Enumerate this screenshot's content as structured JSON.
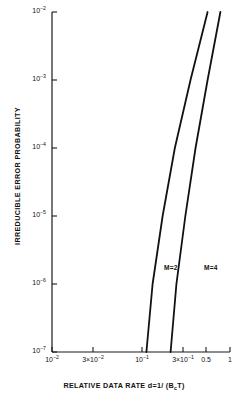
{
  "chart_data": {
    "type": "line",
    "title": "",
    "xlabel": "RELATIVE DATA RATE d=1/ (BₑT)",
    "ylabel": "IRREDUCIBLE ERROR PROBABILITY",
    "xscale": "log",
    "yscale": "log",
    "xlim": [
      0.01,
      1
    ],
    "ylim": [
      1e-07,
      0.01
    ],
    "grid": false,
    "legend_position": "inline-annotations",
    "xticks": [
      {
        "value": 0.01,
        "label": "10",
        "exp": "−2",
        "px": 52
      },
      {
        "value": 0.03,
        "label": "3×10",
        "exp": "−2",
        "px": 93
      },
      {
        "value": 0.1,
        "label": "10",
        "exp": "−1",
        "px": 142
      },
      {
        "value": 0.3,
        "label": "3×10",
        "exp": "−1",
        "px": 183
      },
      {
        "value": 0.5,
        "label": "0.5",
        "exp": "",
        "px": 206
      },
      {
        "value": 1.0,
        "label": "1",
        "exp": "",
        "px": 230
      }
    ],
    "yticks": [
      {
        "value": 0.01,
        "label": "10",
        "exp": "−2",
        "px": 12
      },
      {
        "value": 0.001,
        "label": "10",
        "exp": "−3",
        "px": 80
      },
      {
        "value": 0.0001,
        "label": "10",
        "exp": "−4",
        "px": 148
      },
      {
        "value": 1e-05,
        "label": "10",
        "exp": "−5",
        "px": 216
      },
      {
        "value": 1e-06,
        "label": "10",
        "exp": "−6",
        "px": 284
      },
      {
        "value": 1e-07,
        "label": "10",
        "exp": "−7",
        "px": 352
      }
    ],
    "series": [
      {
        "name": "M=2",
        "label": "M=2",
        "label_px": {
          "x": 164,
          "y": 264
        },
        "points": [
          {
            "x": 0.115,
            "y": 1e-07
          },
          {
            "x": 0.135,
            "y": 1e-06
          },
          {
            "x": 0.175,
            "y": 1e-05
          },
          {
            "x": 0.24,
            "y": 0.0001
          },
          {
            "x": 0.36,
            "y": 0.001
          },
          {
            "x": 0.56,
            "y": 0.01
          }
        ]
      },
      {
        "name": "M=4",
        "label": "M=4",
        "label_px": {
          "x": 204,
          "y": 264
        },
        "points": [
          {
            "x": 0.215,
            "y": 1e-07
          },
          {
            "x": 0.25,
            "y": 1e-06
          },
          {
            "x": 0.315,
            "y": 1e-05
          },
          {
            "x": 0.41,
            "y": 0.0001
          },
          {
            "x": 0.56,
            "y": 0.001
          },
          {
            "x": 0.78,
            "y": 0.01
          }
        ]
      }
    ]
  },
  "axes": {
    "x_title": "RELATIVE DATA RATE d=1/ (BₑT)",
    "x_title_parts": {
      "main": "RELATIVE DATA RATE d=1/ (B",
      "sub": "c",
      "tail": "T)"
    },
    "y_title": "IRREDUCIBLE ERROR PROBABILITY"
  },
  "colors": {
    "axis": "#1a1a1a",
    "curve": "#111111",
    "background": "#ffffff",
    "text": "#111111"
  }
}
